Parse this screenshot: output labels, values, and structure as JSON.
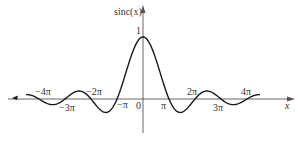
{
  "chart_data": {
    "type": "line",
    "title": "",
    "xlabel": "x",
    "ylabel": "sinc(x)",
    "function": "sinc(x) = sin(x)/x",
    "xlim_pi_units": [
      -4.5,
      4.5
    ],
    "ylim": [
      -0.25,
      1.3
    ],
    "grid": false,
    "legend": null,
    "x_tick_labels": [
      "-4π",
      "-3π",
      "-2π",
      "-π",
      "0",
      "π",
      "2π",
      "3π",
      "4π"
    ],
    "x_tick_values_pi_units": [
      -4,
      -3,
      -2,
      -1,
      0,
      1,
      2,
      3,
      4
    ],
    "y_tick_labels": [
      "1"
    ],
    "y_tick_values": [
      1
    ],
    "series": [
      {
        "name": "sinc(x)",
        "x_pi_units": [
          -4.5,
          -4,
          -3.5,
          -3,
          -2.5,
          -2,
          -1.5,
          -1,
          -0.5,
          0,
          0.5,
          1,
          1.5,
          2,
          2.5,
          3,
          3.5,
          4,
          4.5
        ],
        "values": [
          -0.0707,
          0,
          0.0909,
          0,
          0.1273,
          0,
          -0.2122,
          0,
          0.6366,
          1,
          0.6366,
          0,
          -0.2122,
          0,
          0.1273,
          0,
          0.0909,
          0,
          -0.0707
        ]
      }
    ],
    "color": "#1a1a1a"
  },
  "layout": {
    "origin_x": 143,
    "origin_y": 99,
    "px_per_pi": 26,
    "px_per_unit_y": 62
  },
  "labels": {
    "y_axis": "sinc(x)",
    "x_axis": "x",
    "one": "1",
    "zero": "0",
    "neg4pi": "−4π",
    "neg3pi": "−3π",
    "neg2pi": "−2π",
    "negpi": "−π",
    "pi": "π",
    "twopi": "2π",
    "threepi": "3π",
    "fourpi": "4π"
  }
}
